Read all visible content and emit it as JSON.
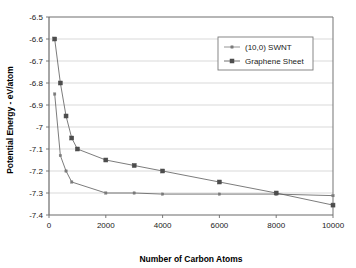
{
  "chart_data": {
    "type": "line",
    "title": "",
    "xlabel": "Number of Carbon Atoms",
    "ylabel": "Potential Energy - eV/atom",
    "xlim": [
      0,
      10000
    ],
    "ylim": [
      -7.4,
      -6.5
    ],
    "xticks": [
      0,
      2000,
      4000,
      6000,
      8000,
      10000
    ],
    "xtick_labels": [
      "0",
      "2000",
      "4000",
      "6000",
      "8000",
      "10000"
    ],
    "yticks": [
      -7.4,
      -7.3,
      -7.2,
      -7.1,
      -7.0,
      -6.9,
      -6.8,
      -6.7,
      -6.6,
      -6.5
    ],
    "ytick_labels": [
      "-7.4",
      "-7.3",
      "-7.2",
      "-7.1",
      "-7",
      "-6.9",
      "-6.8",
      "-6.7",
      "-6.6",
      "-6.5"
    ],
    "grid": "horizontal",
    "legend_position": "top-right",
    "series": [
      {
        "name": "(10,0) SWNT",
        "marker": "small-dot",
        "color": "#7a7a7a",
        "points": [
          {
            "x": 200,
            "y": -6.85
          },
          {
            "x": 400,
            "y": -7.13
          },
          {
            "x": 600,
            "y": -7.2
          },
          {
            "x": 800,
            "y": -7.25
          },
          {
            "x": 2000,
            "y": -7.3
          },
          {
            "x": 3000,
            "y": -7.3
          },
          {
            "x": 4000,
            "y": -7.305
          },
          {
            "x": 6000,
            "y": -7.305
          },
          {
            "x": 8000,
            "y": -7.305
          },
          {
            "x": 10000,
            "y": -7.312
          }
        ]
      },
      {
        "name": "Graphene Sheet",
        "marker": "square",
        "color": "#4d4d4d",
        "points": [
          {
            "x": 200,
            "y": -6.6
          },
          {
            "x": 400,
            "y": -6.8
          },
          {
            "x": 600,
            "y": -6.95
          },
          {
            "x": 800,
            "y": -7.05
          },
          {
            "x": 1000,
            "y": -7.1
          },
          {
            "x": 2000,
            "y": -7.15
          },
          {
            "x": 3000,
            "y": -7.175
          },
          {
            "x": 4000,
            "y": -7.2
          },
          {
            "x": 6000,
            "y": -7.25
          },
          {
            "x": 8000,
            "y": -7.3
          },
          {
            "x": 10000,
            "y": -7.355
          }
        ]
      }
    ],
    "legend_entries": [
      "(10,0) SWNT",
      "Graphene Sheet"
    ]
  },
  "colors": {
    "background": "#ffffff",
    "grid": "#c0c0c0",
    "frame": "#808080",
    "text": "#1a1a1a",
    "series_swnt": "#7a7a7a",
    "series_graphene": "#4d4d4d"
  }
}
